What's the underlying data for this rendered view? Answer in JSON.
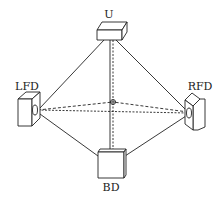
{
  "diagram": {
    "title": "",
    "nodes": [
      {
        "id": "U",
        "label": "U",
        "x": 110,
        "y": 32
      },
      {
        "id": "LFD",
        "label": "LFD",
        "x": 37,
        "y": 112
      },
      {
        "id": "RFD",
        "label": "RFD",
        "x": 188,
        "y": 114
      },
      {
        "id": "BD",
        "label": "BD",
        "x": 111,
        "y": 164
      }
    ],
    "center": {
      "x": 113,
      "y": 102
    },
    "solid_edges": [
      [
        "U",
        "LFD"
      ],
      [
        "U",
        "RFD"
      ],
      [
        "U",
        "BD"
      ],
      [
        "LFD",
        "BD"
      ],
      [
        "RFD",
        "BD"
      ]
    ],
    "dashed_edges": [
      [
        "U",
        "BD"
      ],
      [
        "LFD",
        "RFD"
      ],
      [
        "LFD",
        "center"
      ],
      [
        "RFD",
        "center"
      ]
    ],
    "colors": {
      "line": "#222222",
      "background": "#ffffff"
    }
  }
}
